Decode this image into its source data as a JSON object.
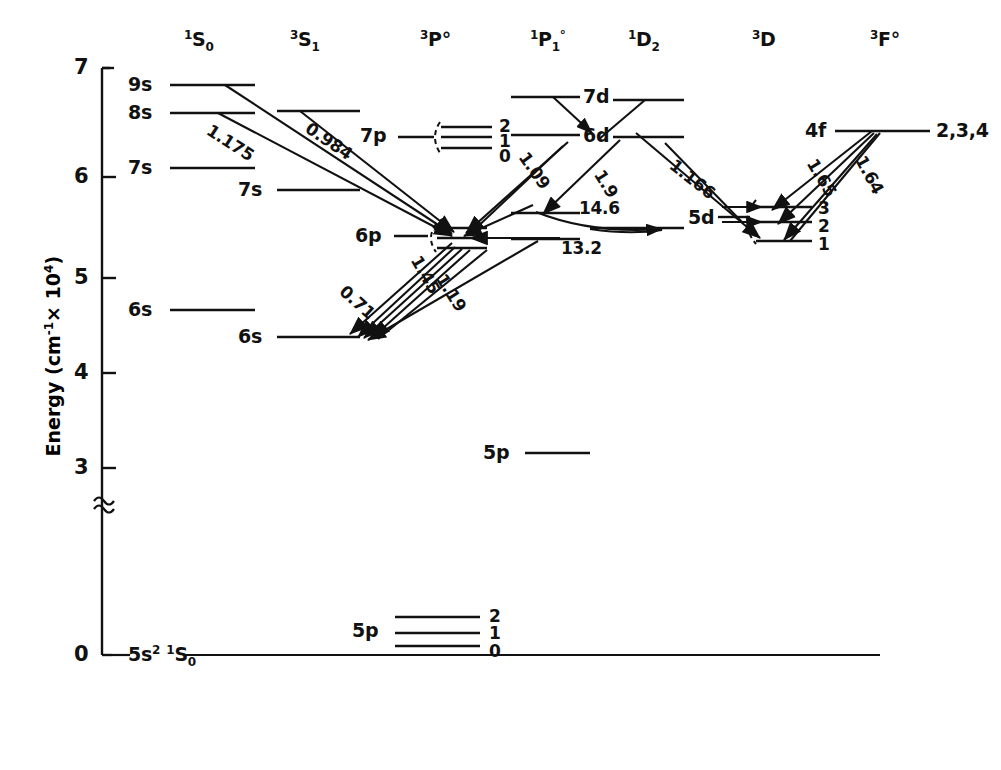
{
  "figure": {
    "type": "grotrian-energy-level-diagram",
    "axis": {
      "title": "Energy (cm",
      "title_sup": "-1",
      "title_tail": "× 10",
      "title_sup2": "4",
      "title_close": ")",
      "ticks": [
        "7",
        "6",
        "5",
        "4",
        "3",
        "0"
      ],
      "break_symbol": "≈"
    },
    "columns": [
      {
        "id": "1S0",
        "sup": "1",
        "letter": "S",
        "sub": "0",
        "post": ""
      },
      {
        "id": "3S1",
        "sup": "3",
        "letter": "S",
        "sub": "1",
        "post": ""
      },
      {
        "id": "3Po",
        "sup": "3",
        "letter": "P",
        "sub": "",
        "post": "°"
      },
      {
        "id": "1Po1",
        "sup": "1",
        "letter": "P",
        "sub": "1",
        "post": "°"
      },
      {
        "id": "1D2",
        "sup": "1",
        "letter": "D",
        "sub": "2",
        "post": ""
      },
      {
        "id": "3D",
        "sup": "3",
        "letter": "D",
        "sub": "",
        "post": ""
      },
      {
        "id": "3Fo",
        "sup": "3",
        "letter": "F",
        "sub": "",
        "post": "°"
      }
    ],
    "levels": [
      {
        "label": "9s",
        "column": "1S0"
      },
      {
        "label": "8s",
        "column": "1S0"
      },
      {
        "label": "7s",
        "column": "1S0"
      },
      {
        "label": "6s",
        "column": "1S0"
      },
      {
        "label": "8s",
        "column": "3S1"
      },
      {
        "label": "7s",
        "column": "3S1"
      },
      {
        "label": "6s",
        "column": "3S1"
      },
      {
        "label": "7p",
        "column": "3Po"
      },
      {
        "label": "6p",
        "column": "3Po"
      },
      {
        "label": "5p",
        "column": "3Po"
      },
      {
        "label": "7d",
        "column": "1Po1"
      },
      {
        "label": "6d",
        "column": "1Po1"
      },
      {
        "label": "5p",
        "column": "1Po1"
      },
      {
        "label": "7d",
        "column": "1D2"
      },
      {
        "label": "6d",
        "column": "1D2"
      },
      {
        "label": "5d",
        "column": "1D2"
      },
      {
        "label": "5d",
        "column": "3D"
      },
      {
        "label": "4f",
        "column": "3Fo"
      }
    ],
    "j_labels": {
      "7p": [
        "2",
        "1",
        "0"
      ],
      "5p_3Po": [
        "2",
        "1",
        "0"
      ],
      "5d_3D": [
        "3",
        "2",
        "1"
      ],
      "4f_3Fo": "2,3,4"
    },
    "ground_state": {
      "n": "5s",
      "sup": "2",
      "term_sup": "1",
      "term": "S",
      "term_sub": "0"
    },
    "transitions": [
      {
        "label": "1.175",
        "from": "9s(1S0)",
        "to": "6p(3Po)"
      },
      {
        "label": "0.984",
        "from": "8s(3S1)",
        "to": "6p(3Po)"
      },
      {
        "label": "1.09",
        "from": "6d(1Po1)",
        "to": "6p(3Po)"
      },
      {
        "label": "1.9",
        "from": "6d(1D2)",
        "to": "5d(1D2)"
      },
      {
        "label": "1.166",
        "from": "6d(1D2)",
        "to": "5d(3D)"
      },
      {
        "label": "14.6",
        "from": "6d-band",
        "to": "5d(1D2)"
      },
      {
        "label": "13.2",
        "from": "5d-band",
        "to": "5d(1D2)"
      },
      {
        "label": "0.71",
        "from": "6p(3Po)",
        "to": "6s(3S1)"
      },
      {
        "label": "1.45",
        "from": "6p(3Po)",
        "to": "6s(3S1)"
      },
      {
        "label": "1.19",
        "from": "6p(3Po)",
        "to": "6s(3S1)"
      },
      {
        "label": "1.65",
        "from": "4f(3Fo)",
        "to": "5d(3D)"
      },
      {
        "label": "1.64",
        "from": "4f(3Fo)",
        "to": "5d(3D)"
      }
    ]
  }
}
